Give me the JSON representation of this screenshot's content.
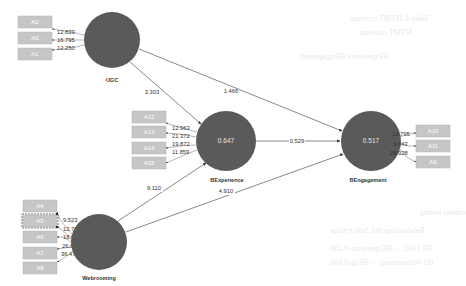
{
  "diagram": {
    "type": "pls-sem-structural-model",
    "colors": {
      "construct_fill": "#5a5a5a",
      "indicator_fill": "#c6c6c6",
      "line": "#6b6b6b",
      "text": "#333333",
      "background": "#ffffff"
    },
    "constructs": [
      {
        "id": "UGC",
        "name": "UGC",
        "value": ""
      },
      {
        "id": "BExperience",
        "name": "BExperience",
        "value": "0.647"
      },
      {
        "id": "BEngagement",
        "name": "BEngagement",
        "value": "0.517"
      },
      {
        "id": "Webrooming",
        "name": "Webrooming",
        "value": ""
      }
    ],
    "indicator_groups": {
      "ugc": {
        "items": [
          {
            "label": "A2",
            "weight": "12.839"
          },
          {
            "label": "A3",
            "weight": "16.795"
          },
          {
            "label": "A1",
            "weight": "12.250"
          }
        ]
      },
      "bexperience": {
        "items": [
          {
            "label": "A12",
            "weight": "12.963"
          },
          {
            "label": "A13",
            "weight": "21.372"
          },
          {
            "label": "A14",
            "weight": "19.872"
          },
          {
            "label": "A15",
            "weight": "11.859"
          }
        ]
      },
      "bengagement": {
        "items": [
          {
            "label": "A10",
            "weight": "12.795"
          },
          {
            "label": "A11",
            "weight": "9.843"
          },
          {
            "label": "A9",
            "weight": "28.928"
          }
        ]
      },
      "webrooming": {
        "selected": "A5",
        "items": [
          {
            "label": "A4",
            "weight": "9.523"
          },
          {
            "label": "A5",
            "weight": "12.767"
          },
          {
            "label": "A6",
            "weight": "18.921"
          },
          {
            "label": "A7",
            "weight": "26.617"
          },
          {
            "label": "A8",
            "weight": "36.479"
          }
        ]
      }
    },
    "paths": [
      {
        "from": "UGC",
        "to": "BExperience",
        "value": "3.303"
      },
      {
        "from": "UGC",
        "to": "BEngagement",
        "value": "1.466"
      },
      {
        "from": "BExperience",
        "to": "BEngagement",
        "value": "0.529"
      },
      {
        "from": "Webrooming",
        "to": "BExperience",
        "value": "9.110"
      },
      {
        "from": "Webrooming",
        "to": "BEngagement",
        "value": "4.910"
      }
    ]
  }
}
